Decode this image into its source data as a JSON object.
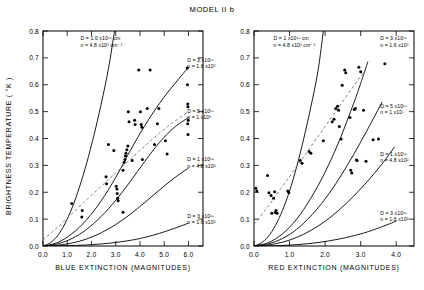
{
  "figure": {
    "title": "MODEL II b",
    "ylabel": "BRIGHTNESS  TEMPERATURE ( °K )"
  },
  "chart_data": [
    {
      "type": "line",
      "panel": "left",
      "title": "MODEL II b",
      "xlabel": "BLUE  EXTINCTION  (MAGNITUDES)",
      "ylabel": "BRIGHTNESS  TEMPERATURE ( °K )",
      "xlim": [
        0.0,
        6.6
      ],
      "ylim": [
        0.0,
        0.8
      ],
      "xticks": [
        "0.0",
        "1.0",
        "2.0",
        "3.0",
        "4.0",
        "5.0",
        "6.0"
      ],
      "xtick_values": [
        0.0,
        1.0,
        2.0,
        3.0,
        4.0,
        5.0,
        6.0
      ],
      "yticks": [
        "0.0",
        "0.1",
        "0.2",
        "0.3",
        "0.4",
        "0.5",
        "0.6",
        "0.7",
        "0.8"
      ],
      "ytick_values": [
        0.0,
        0.1,
        0.2,
        0.3,
        0.4,
        0.5,
        0.6,
        0.7,
        0.8
      ],
      "grid": false,
      "legend": "inline-annotations",
      "annotations": [
        {
          "id": "a1",
          "text": "D = 1.0 x10¹⁸ cm",
          "text2": "n = 4.8 x10³ cm⁻³",
          "x": 1.55,
          "y": 0.765
        },
        {
          "id": "a2",
          "text": "D = 3 x10¹⁸",
          "text2": "n = 1.6 x10³",
          "x": 5.95,
          "y": 0.685
        },
        {
          "id": "a3",
          "text": "D = 5 x10¹⁸",
          "text2": "n = 1 x10³",
          "x": 5.95,
          "y": 0.495
        },
        {
          "id": "a4",
          "text": "D = 1 x10¹⁹",
          "text2": "n = 4.8 x10²",
          "x": 5.95,
          "y": 0.315
        },
        {
          "id": "a5",
          "text": "D = 3 x10¹⁹",
          "text2": "n = 1.6 x10²",
          "x": 5.95,
          "y": 0.105
        }
      ],
      "series": [
        {
          "name": "D=1.0x10^18, n=4.8x10^3",
          "style": "solid",
          "x": [
            0.0,
            0.3,
            0.6,
            0.9,
            1.2,
            1.5,
            1.8,
            2.1,
            2.4,
            2.7,
            2.95
          ],
          "y": [
            0.0,
            0.012,
            0.038,
            0.082,
            0.142,
            0.218,
            0.308,
            0.412,
            0.528,
            0.66,
            0.8
          ]
        },
        {
          "name": "D=3x10^18, n=1.6x10^3",
          "style": "solid",
          "x": [
            0.0,
            0.6,
            1.2,
            1.8,
            2.4,
            3.0,
            3.6,
            4.2,
            4.8,
            5.4,
            6.0
          ],
          "y": [
            0.0,
            0.013,
            0.046,
            0.098,
            0.168,
            0.255,
            0.355,
            0.448,
            0.53,
            0.6,
            0.665
          ]
        },
        {
          "name": "D=5x10^18, n=1x10^3",
          "style": "solid",
          "x": [
            0.0,
            0.6,
            1.2,
            1.8,
            2.4,
            3.0,
            3.6,
            4.2,
            4.8,
            5.4,
            6.0
          ],
          "y": [
            0.0,
            0.008,
            0.028,
            0.062,
            0.11,
            0.17,
            0.24,
            0.315,
            0.385,
            0.44,
            0.478
          ]
        },
        {
          "name": "D=1x10^19, n=4.8x10^2",
          "style": "solid",
          "x": [
            0.0,
            0.6,
            1.2,
            1.8,
            2.4,
            3.0,
            3.6,
            4.2,
            4.8,
            5.4,
            6.0
          ],
          "y": [
            0.0,
            0.003,
            0.011,
            0.026,
            0.049,
            0.08,
            0.118,
            0.162,
            0.208,
            0.252,
            0.29
          ]
        },
        {
          "name": "D=3x10^19, n=1.6x10^2",
          "style": "solid",
          "x": [
            0.0,
            0.9,
            1.8,
            2.7,
            3.6,
            4.2,
            4.8,
            5.4,
            6.0
          ],
          "y": [
            0.0,
            0.001,
            0.004,
            0.01,
            0.021,
            0.032,
            0.047,
            0.065,
            0.085
          ]
        },
        {
          "name": "observed-fit",
          "style": "dashed",
          "x": [
            0.0,
            0.6,
            1.2,
            1.8,
            2.4,
            3.0,
            3.6,
            4.2,
            4.8,
            5.4,
            6.0
          ],
          "y": [
            0.022,
            0.07,
            0.12,
            0.172,
            0.222,
            0.272,
            0.322,
            0.372,
            0.42,
            0.462,
            0.5
          ]
        }
      ],
      "scatter": {
        "name": "observations",
        "marker": "filled-circle",
        "points": [
          [
            1.18,
            0.158
          ],
          [
            1.62,
            0.132
          ],
          [
            1.6,
            0.108
          ],
          [
            2.6,
            0.258
          ],
          [
            2.62,
            0.232
          ],
          [
            2.92,
            0.355
          ],
          [
            2.7,
            0.378
          ],
          [
            3.02,
            0.222
          ],
          [
            3.05,
            0.212
          ],
          [
            3.06,
            0.195
          ],
          [
            3.08,
            0.178
          ],
          [
            3.1,
            0.168
          ],
          [
            3.3,
            0.282
          ],
          [
            3.35,
            0.312
          ],
          [
            3.38,
            0.322
          ],
          [
            3.4,
            0.335
          ],
          [
            3.42,
            0.345
          ],
          [
            3.46,
            0.358
          ],
          [
            3.5,
            0.372
          ],
          [
            3.52,
            0.5
          ],
          [
            3.55,
            0.462
          ],
          [
            3.3,
            0.126
          ],
          [
            3.68,
            0.318
          ],
          [
            3.78,
            0.468
          ],
          [
            3.8,
            0.452
          ],
          [
            3.95,
            0.655
          ],
          [
            4.02,
            0.5
          ],
          [
            4.05,
            0.452
          ],
          [
            4.08,
            0.442
          ],
          [
            4.1,
            0.322
          ],
          [
            4.3,
            0.512
          ],
          [
            4.42,
            0.655
          ],
          [
            4.6,
            0.378
          ],
          [
            4.72,
            0.455
          ],
          [
            4.78,
            0.512
          ],
          [
            5.05,
            0.392
          ],
          [
            5.12,
            0.342
          ],
          [
            5.95,
            0.662
          ],
          [
            5.96,
            0.6
          ],
          [
            5.97,
            0.528
          ],
          [
            5.98,
            0.518
          ],
          [
            5.99,
            0.468
          ],
          [
            5.97,
            0.455
          ],
          [
            5.98,
            0.415
          ]
        ]
      }
    },
    {
      "type": "line",
      "panel": "right",
      "title": "MODEL II b",
      "xlabel": "RED EXTINCTION (MAGNITUDES)",
      "ylabel": "BRIGHTNESS  TEMPERATURE ( °K )",
      "xlim": [
        0.0,
        4.5
      ],
      "ylim": [
        0.0,
        0.8
      ],
      "xticks": [
        "0.0",
        "1.0",
        "2.0",
        "3.0",
        "4.0"
      ],
      "xtick_values": [
        0.0,
        1.0,
        2.0,
        3.0,
        4.0
      ],
      "yticks": [
        "0.0",
        "0.1",
        "0.2",
        "0.3",
        "0.4",
        "0.5",
        "0.6",
        "0.7",
        "0.8"
      ],
      "ytick_values": [
        0.0,
        0.1,
        0.2,
        0.3,
        0.4,
        0.5,
        0.6,
        0.7,
        0.8
      ],
      "grid": false,
      "legend": "inline-annotations",
      "annotations": [
        {
          "id": "b1",
          "text": "D = 1 x10¹⁸ cm",
          "text2": "n = 4.8 x10³ cm⁻³",
          "x": 0.55,
          "y": 0.765
        },
        {
          "id": "b2",
          "text": "D = 3 x10¹⁸",
          "text2": "n = 1.6 x10³",
          "x": 3.55,
          "y": 0.765
        },
        {
          "id": "b3",
          "text": "D = 5 x10¹⁸",
          "text2": "n = 1 x10⁷",
          "x": 3.55,
          "y": 0.515
        },
        {
          "id": "b4",
          "text": "D = 1 x10¹⁹",
          "text2": "n = 4.8 x10²",
          "x": 3.55,
          "y": 0.335
        },
        {
          "id": "b5",
          "text": "D = 3 x10¹⁹",
          "text2": "n = 1.6 x10²",
          "x": 3.55,
          "y": 0.115
        }
      ],
      "series": [
        {
          "name": "D=1x10^18, n=4.8x10^3",
          "style": "solid",
          "x": [
            0.0,
            0.2,
            0.4,
            0.6,
            0.8,
            1.0,
            1.2,
            1.4,
            1.6,
            1.8,
            1.95
          ],
          "y": [
            0.0,
            0.011,
            0.035,
            0.076,
            0.132,
            0.205,
            0.295,
            0.4,
            0.518,
            0.652,
            0.8
          ]
        },
        {
          "name": "D=3x10^18, n=1.6x10^3",
          "style": "solid",
          "x": [
            0.0,
            0.4,
            0.8,
            1.2,
            1.6,
            2.0,
            2.4,
            2.8,
            3.0,
            3.2
          ],
          "y": [
            0.0,
            0.012,
            0.045,
            0.1,
            0.178,
            0.275,
            0.392,
            0.53,
            0.605,
            0.685
          ]
        },
        {
          "name": "D=5x10^18, n=1x10^7",
          "style": "solid",
          "x": [
            0.0,
            0.4,
            0.8,
            1.2,
            1.6,
            2.0,
            2.4,
            2.8,
            3.2,
            3.6
          ],
          "y": [
            0.0,
            0.008,
            0.028,
            0.062,
            0.112,
            0.175,
            0.252,
            0.34,
            0.435,
            0.535
          ]
        },
        {
          "name": "D=1x10^19, n=4.8x10^2",
          "style": "solid",
          "x": [
            0.0,
            0.4,
            0.8,
            1.2,
            1.6,
            2.0,
            2.4,
            2.8,
            3.2,
            3.6,
            3.95
          ],
          "y": [
            0.0,
            0.004,
            0.014,
            0.032,
            0.058,
            0.092,
            0.135,
            0.185,
            0.242,
            0.305,
            0.368
          ]
        },
        {
          "name": "D=3x10^19, n=1.6x10^2",
          "style": "solid",
          "x": [
            0.0,
            0.6,
            1.2,
            1.8,
            2.4,
            3.0,
            3.4,
            3.8,
            4.0
          ],
          "y": [
            0.0,
            0.001,
            0.005,
            0.013,
            0.026,
            0.045,
            0.062,
            0.082,
            0.093
          ]
        },
        {
          "name": "observed-fit",
          "style": "dashed",
          "x": [
            0.0,
            0.4,
            0.8,
            1.2,
            1.6,
            2.0,
            2.4,
            2.8,
            3.1
          ],
          "y": [
            0.08,
            0.148,
            0.222,
            0.295,
            0.37,
            0.445,
            0.52,
            0.595,
            0.65
          ]
        }
      ],
      "scatter": {
        "name": "observations",
        "marker": "filled-circle",
        "points": [
          [
            0.05,
            0.215
          ],
          [
            0.08,
            0.205
          ],
          [
            0.38,
            0.262
          ],
          [
            0.42,
            0.198
          ],
          [
            0.48,
            0.188
          ],
          [
            0.55,
            0.178
          ],
          [
            0.58,
            0.202
          ],
          [
            0.62,
            0.132
          ],
          [
            0.65,
            0.122
          ],
          [
            0.95,
            0.205
          ],
          [
            0.98,
            0.198
          ],
          [
            1.3,
            0.318
          ],
          [
            1.35,
            0.308
          ],
          [
            1.55,
            0.352
          ],
          [
            1.6,
            0.345
          ],
          [
            1.95,
            0.392
          ],
          [
            2.2,
            0.462
          ],
          [
            2.25,
            0.472
          ],
          [
            2.3,
            0.512
          ],
          [
            2.35,
            0.52
          ],
          [
            2.38,
            0.505
          ],
          [
            2.4,
            0.445
          ],
          [
            2.45,
            0.398
          ],
          [
            2.48,
            0.598
          ],
          [
            2.55,
            0.655
          ],
          [
            2.58,
            0.645
          ],
          [
            2.7,
            0.478
          ],
          [
            2.72,
            0.282
          ],
          [
            2.75,
            0.272
          ],
          [
            2.85,
            0.512
          ],
          [
            2.88,
            0.32
          ],
          [
            2.9,
            0.318
          ],
          [
            2.95,
            0.665
          ],
          [
            3.0,
            0.648
          ],
          [
            3.08,
            0.505
          ],
          [
            3.15,
            0.315
          ],
          [
            3.35,
            0.395
          ],
          [
            3.5,
            0.398
          ],
          [
            3.68,
            0.678
          ],
          [
            2.82,
            0.508
          ],
          [
            0.5,
            0.122
          ],
          [
            0.6,
            0.125
          ]
        ]
      }
    }
  ]
}
